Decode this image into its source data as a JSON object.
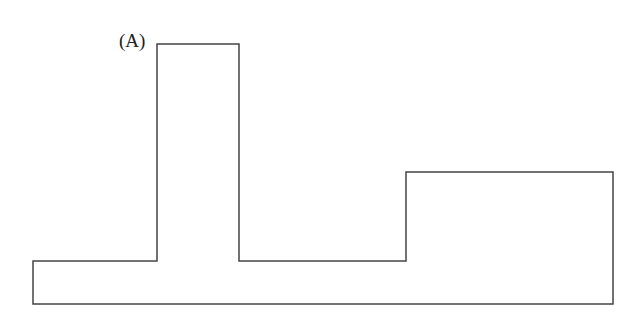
{
  "diagram": {
    "label": "(A)",
    "stroke_color": "#444444",
    "outline_points": "33,261 157,261 157,44 239,44 239,261 406,261 406,172 613,172 613,304 33,304"
  }
}
